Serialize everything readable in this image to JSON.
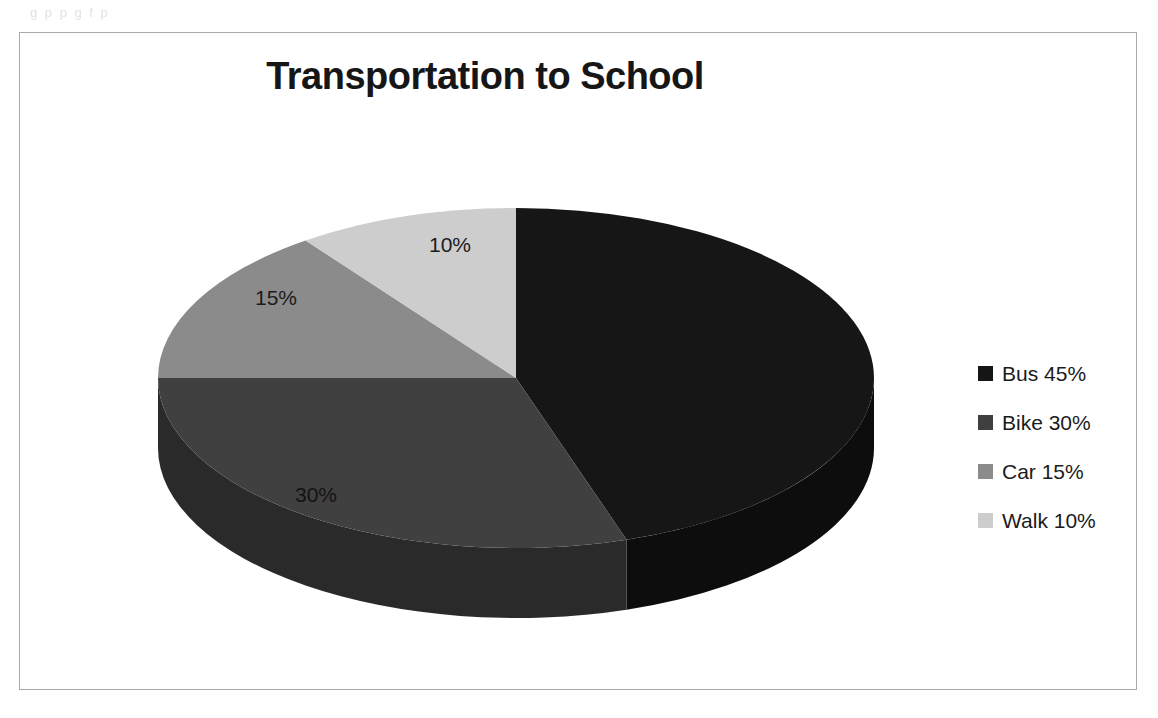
{
  "scan_artifact_text": "g p    p      g     f                            p",
  "chart": {
    "title": "Transportation to School",
    "legend_position": "right"
  },
  "chart_data": {
    "type": "pie",
    "title": "Transportation to School",
    "xlabel": "",
    "ylabel": "",
    "three_d": true,
    "start_angle_deg": 0,
    "direction": "clockwise",
    "legend_position": "right",
    "grid": false,
    "categories": [
      "Bus",
      "Bike",
      "Car",
      "Walk"
    ],
    "values": [
      45,
      30,
      15,
      10
    ],
    "value_unit": "%",
    "data_labels": [
      "45%",
      "30%",
      "15%",
      "10%"
    ],
    "visible_data_labels": [
      "30%",
      "15%",
      "10%"
    ],
    "legend_entries": [
      "Bus 45%",
      "Bike 30%",
      "Car 15%",
      "Walk 10%"
    ],
    "colors": [
      "#151515",
      "#3f3f3f",
      "#8b8b8b",
      "#cdcdcd"
    ],
    "side_colors": [
      "#0a0a0a",
      "#2a2a2a",
      "#6d6d6d",
      "#a8a8a8"
    ]
  },
  "labels": {
    "bus": "45%",
    "bike": "30%",
    "car": "15%",
    "walk": "10%"
  },
  "legend": {
    "items": [
      {
        "label": "Bus 45%",
        "color": "#151515"
      },
      {
        "label": "Bike 30%",
        "color": "#3f3f3f"
      },
      {
        "label": "Car 15%",
        "color": "#8b8b8b"
      },
      {
        "label": "Walk 10%",
        "color": "#cdcdcd"
      }
    ]
  }
}
